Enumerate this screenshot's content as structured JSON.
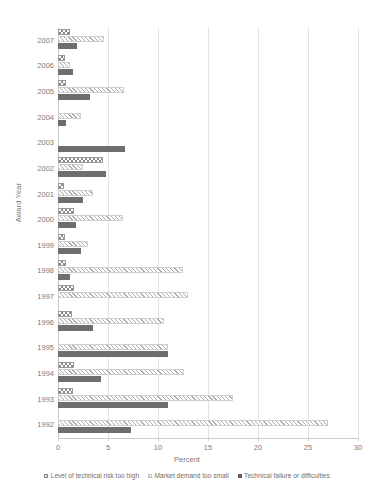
{
  "chart_data": {
    "type": "bar",
    "orientation": "horizontal",
    "title": "",
    "xlabel": "Percent",
    "ylabel": "Award Year",
    "xlim": [
      0,
      30
    ],
    "xticks": [
      0,
      5,
      10,
      15,
      20,
      25,
      30
    ],
    "grid": true,
    "legend_position": "bottom",
    "categories": [
      "2007",
      "2006",
      "2005",
      "2004",
      "2003",
      "2002",
      "2001",
      "2000",
      "1999",
      "1998",
      "1997",
      "1996",
      "1995",
      "1994",
      "1993",
      "1992"
    ],
    "series": [
      {
        "name": "Level of technical risk too high",
        "pattern": "checkered",
        "color": "#8a8a8a",
        "values": [
          1.2,
          0.7,
          0.8,
          0.0,
          0.0,
          4.5,
          0.6,
          1.6,
          0.7,
          0.8,
          1.6,
          1.4,
          0.0,
          1.6,
          1.5,
          0.0
        ]
      },
      {
        "name": "Market demand too small",
        "pattern": "diagonal-hatch",
        "color": "#adadad",
        "values": [
          4.6,
          1.2,
          6.6,
          2.3,
          0.0,
          2.5,
          3.5,
          6.5,
          3.0,
          12.5,
          13.0,
          10.6,
          11.0,
          12.6,
          17.5,
          27.0
        ]
      },
      {
        "name": "Technical failure or difficulties",
        "pattern": "solid",
        "color": "#6e6e6e",
        "values": [
          1.9,
          1.5,
          3.2,
          0.8,
          6.7,
          4.8,
          2.5,
          1.8,
          2.3,
          1.2,
          0.0,
          3.5,
          11.0,
          4.3,
          11.0,
          7.3
        ]
      }
    ]
  }
}
